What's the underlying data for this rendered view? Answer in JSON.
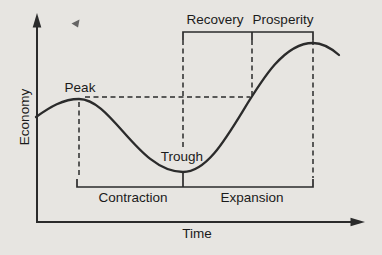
{
  "figure": {
    "type": "business-cycle-diagram",
    "axes": {
      "y_label": "Economy",
      "x_label": "Time"
    },
    "curve_points": {
      "peak": "Peak",
      "trough": "Trough"
    },
    "phases": {
      "recovery": "Recovery",
      "prosperity": "Prosperity",
      "contraction": "Contraction",
      "expansion": "Expansion"
    },
    "colors": {
      "background": "#e7e5e1",
      "line": "#2b2b2b",
      "text": "#1b1b1b"
    },
    "icons": {
      "stray_mark": "small-left-arrowhead"
    }
  }
}
